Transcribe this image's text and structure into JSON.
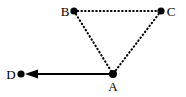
{
  "figure": {
    "kind": "vector-geometry-diagram",
    "width": 186,
    "height": 97,
    "background_color": "#ffffff",
    "ink_color": "#000000"
  },
  "points": [
    {
      "id": "B",
      "label": "B",
      "x": 74,
      "y": 11,
      "dot_radius": 3.6,
      "label_x": 65,
      "label_y": 16,
      "label_anchor": "middle",
      "label_position": "left"
    },
    {
      "id": "C",
      "label": "C",
      "x": 161,
      "y": 11,
      "dot_radius": 3.6,
      "label_x": 171,
      "label_y": 16,
      "label_anchor": "middle",
      "label_position": "right"
    },
    {
      "id": "A",
      "label": "A",
      "x": 113,
      "y": 74,
      "dot_radius": 4.0,
      "label_x": 113,
      "label_y": 91,
      "label_anchor": "middle",
      "label_position": "below"
    },
    {
      "id": "D",
      "label": "D",
      "x": 21,
      "y": 74,
      "dot_radius": 3.6,
      "label_x": 11,
      "label_y": 79,
      "label_anchor": "middle",
      "label_position": "left"
    }
  ],
  "edges": [
    {
      "id": "BC",
      "from": "B",
      "to": "C",
      "x1": 74,
      "y1": 11,
      "x2": 161,
      "y2": 11,
      "style": "dotted",
      "stroke_width": 2.1,
      "dash_pattern": "0.5 3.2",
      "arrow": false
    },
    {
      "id": "BA",
      "from": "B",
      "to": "A",
      "x1": 74,
      "y1": 11,
      "x2": 113,
      "y2": 74,
      "style": "dotted",
      "stroke_width": 2.1,
      "dash_pattern": "0.5 3.2",
      "arrow": false
    },
    {
      "id": "CA",
      "from": "C",
      "to": "A",
      "x1": 161,
      "y1": 11,
      "x2": 113,
      "y2": 74,
      "style": "dotted",
      "stroke_width": 2.1,
      "dash_pattern": "0.5 3.2",
      "arrow": false
    },
    {
      "id": "AD",
      "from": "A",
      "to": "D",
      "x1": 113,
      "y1": 74,
      "x2": 26,
      "y2": 74,
      "style": "solid",
      "stroke_width": 1.8,
      "dash_pattern": "",
      "arrow": true
    }
  ],
  "arrowhead": {
    "id": "AD-arrowhead",
    "tip_x": 25,
    "tip_y": 74,
    "back_x": 38,
    "half_width": 4.6,
    "direction": "left",
    "points": "25,74 38,69.4 38,78.6"
  }
}
